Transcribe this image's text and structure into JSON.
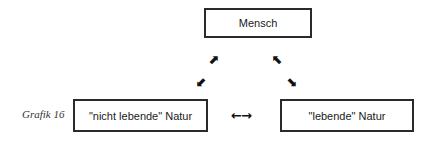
{
  "caption": "Grafik 16",
  "nodes": {
    "top": "Mensch",
    "left": "\"nicht lebende\" Natur",
    "right": "\"lebende\" Natur"
  },
  "arrows": {
    "left_up": "⬈",
    "left_down": "⬋",
    "right_up": "⬉",
    "right_down": "⬊",
    "horizontal": "←→"
  }
}
